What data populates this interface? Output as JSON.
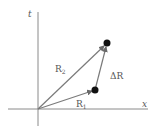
{
  "diagram": {
    "title": "",
    "axes": {
      "x_label": "x",
      "y_label": "t",
      "origin": [
        38,
        109
      ],
      "x_axis": {
        "from": 8,
        "to": 148
      },
      "y_axis": {
        "from": 12,
        "to": 126
      }
    },
    "vectors": [
      {
        "id": "R1",
        "label_main": "R",
        "label_sub": "1",
        "from": [
          38,
          109
        ],
        "to": [
          95,
          90
        ]
      },
      {
        "id": "R2",
        "label_main": "R",
        "label_sub": "2",
        "from": [
          38,
          109
        ],
        "to": [
          107,
          43
        ]
      },
      {
        "id": "dR",
        "label_main": "ΔR",
        "label_sub": "",
        "from": [
          95,
          90
        ],
        "to": [
          107,
          43
        ]
      }
    ],
    "points": [
      {
        "id": "event-1",
        "at": [
          95,
          90
        ]
      },
      {
        "id": "event-2",
        "at": [
          107,
          43
        ]
      }
    ],
    "colors": {
      "axis": "#8a8a8a",
      "vector": "#7a7a7a",
      "point": "#111111",
      "label": "#555555"
    }
  }
}
